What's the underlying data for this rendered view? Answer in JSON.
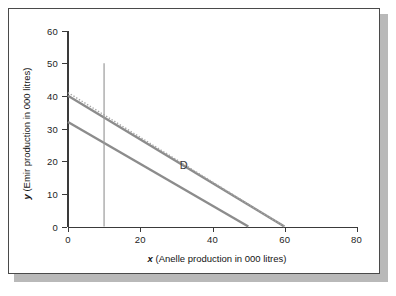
{
  "figure": {
    "background": "#ffffff",
    "border_color": "#4a4a4a",
    "shadow_color": "#b9b9b9"
  },
  "chart_data": {
    "type": "line",
    "title": "",
    "xlabel_prefix": "x",
    "xlabel_text": " (Anelle production in 000 litres)",
    "ylabel_prefix": "y",
    "ylabel_text": " (Emir production in 000 litres)",
    "xlim": [
      0,
      80
    ],
    "ylim": [
      0,
      60
    ],
    "xticks": [
      0,
      20,
      40,
      60,
      80
    ],
    "yticks": [
      0,
      10,
      20,
      30,
      40,
      50,
      60
    ],
    "xtick_labels": [
      "0",
      "20",
      "40",
      "60",
      "80"
    ],
    "ytick_labels": [
      "0",
      "10",
      "20",
      "30",
      "40",
      "50",
      "60"
    ],
    "grid": false,
    "legend": "none",
    "series": [
      {
        "name": "constraint-line-1",
        "style": "solid",
        "color": "#8c8c8c",
        "width": 2.4,
        "points": [
          [
            0,
            40
          ],
          [
            60,
            0
          ]
        ]
      },
      {
        "name": "constraint-line-2",
        "style": "solid",
        "color": "#8c8c8c",
        "width": 2.4,
        "points": [
          [
            0,
            32
          ],
          [
            50,
            0
          ]
        ]
      },
      {
        "name": "vertical-constraint",
        "style": "solid",
        "color": "#9a9a9a",
        "width": 1.2,
        "points": [
          [
            10,
            0
          ],
          [
            10,
            50
          ]
        ]
      },
      {
        "name": "objective-dotted-line",
        "style": "dotted",
        "color": "#a6a6a6",
        "width": 1.4,
        "points": [
          [
            0,
            41
          ],
          [
            60,
            0
          ]
        ]
      }
    ],
    "annotations": [
      {
        "label": "D",
        "x": 31,
        "y": 17.5,
        "color": "#3c3c3c"
      }
    ]
  }
}
